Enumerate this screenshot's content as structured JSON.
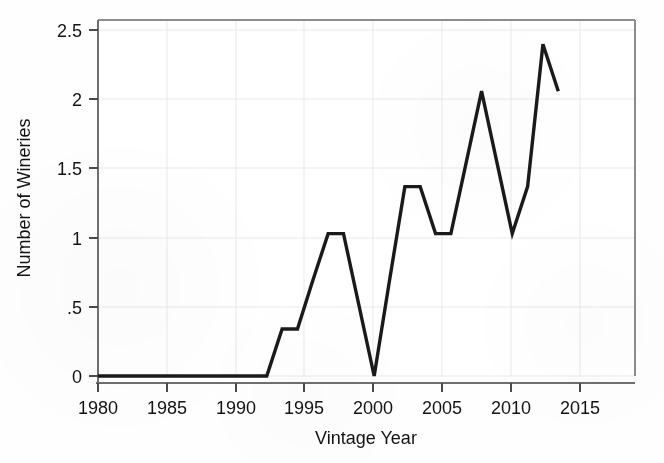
{
  "chart_data": {
    "type": "line",
    "title": "",
    "xlabel": "Vintage Year",
    "ylabel": "Number of Wineries",
    "xlim": [
      1980,
      2015
    ],
    "ylim": [
      0,
      2.5
    ],
    "grid": true,
    "legend": null,
    "line_color": "#1a1a1a",
    "x": [
      1980,
      1981,
      1982,
      1983,
      1984,
      1985,
      1986,
      1987,
      1988,
      1989,
      1990,
      1991,
      1992,
      1993,
      1994,
      1995,
      1996,
      1997,
      1998,
      1999,
      2000,
      2001,
      2002,
      2003,
      2004,
      2005,
      2006,
      2007,
      2008,
      2009,
      2010
    ],
    "values": [
      0,
      0,
      0,
      0,
      0,
      0,
      0,
      0,
      0,
      0,
      0,
      0,
      0.33,
      0.33,
      0.67,
      1,
      1,
      0.5,
      0,
      0.67,
      1.33,
      1.33,
      1,
      1,
      1.5,
      2,
      1.5,
      1,
      1.33,
      2.33,
      2
    ],
    "xticks": [
      1980,
      1985,
      1990,
      1995,
      2000,
      2005,
      2010,
      2015
    ],
    "xtick_labels": [
      "1980",
      "1985",
      "1990",
      "1995",
      "2000",
      "2005",
      "2010",
      "2015"
    ],
    "yticks": [
      0,
      0.5,
      1,
      1.5,
      2,
      2.5
    ],
    "ytick_labels": [
      "0",
      ".5",
      "1",
      "1.5",
      "2",
      "2.5"
    ]
  },
  "axes": {
    "y_title": "Number of Wineries",
    "x_title": "Vintage Year",
    "y_labels": [
      "2.5",
      "2",
      "1.5",
      "1",
      ".5",
      "0"
    ],
    "x_labels": [
      "1980",
      "1985",
      "1990",
      "1995",
      "2000",
      "2005",
      "2010",
      "2015"
    ]
  }
}
